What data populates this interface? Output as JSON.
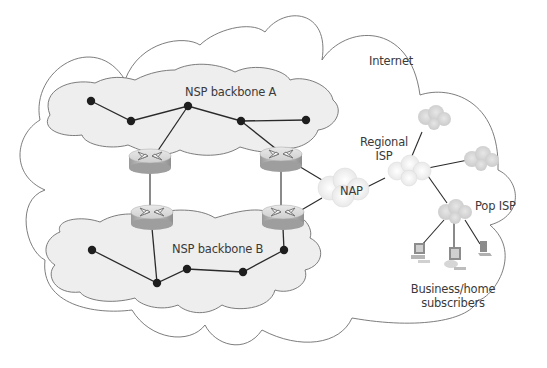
{
  "diagram": {
    "labels": {
      "internet": "Internet",
      "nsp_a": "NSP backbone A",
      "nsp_b": "NSP backbone B",
      "regional_isp_line1": "Regional",
      "regional_isp_line2": "ISP",
      "nap": "NAP",
      "pop_isp": "Pop ISP",
      "subscribers_line1": "Business/home",
      "subscribers_line2": "subscribers"
    },
    "colors": {
      "background": "#ffffff",
      "outline": "#6e6e6e",
      "backbone_fill": "#eeeeee",
      "node": "#1e1e1e",
      "link": "#2a2a2a",
      "small_cloud_fill": "#d9d9d9",
      "router_body": "#b8b8b8"
    },
    "backbone_a_nodes": [
      [
        91,
        101
      ],
      [
        131,
        121
      ],
      [
        188,
        106
      ],
      [
        241,
        121
      ],
      [
        306,
        120
      ]
    ],
    "backbone_b_nodes": [
      [
        92,
        250
      ],
      [
        157,
        283
      ],
      [
        187,
        269
      ],
      [
        243,
        272
      ],
      [
        284,
        250
      ]
    ],
    "routers": [
      {
        "id": "router-a-left",
        "x": 148,
        "y": 160
      },
      {
        "id": "router-a-right",
        "x": 280,
        "y": 158
      },
      {
        "id": "router-b-left",
        "x": 150,
        "y": 218
      },
      {
        "id": "router-b-right",
        "x": 281,
        "y": 218
      }
    ],
    "devices": [
      "desktop-computer",
      "desktop-computer",
      "laptop"
    ]
  }
}
